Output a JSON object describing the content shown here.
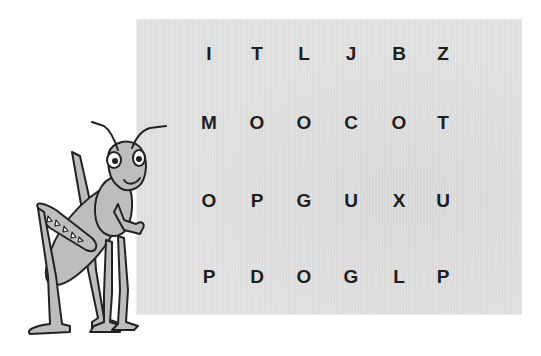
{
  "puzzle": {
    "type": "letter-grid",
    "rows": [
      [
        "I",
        "T",
        "L",
        "J",
        "B",
        "Z"
      ],
      [
        "M",
        "O",
        "O",
        "C",
        "O",
        "T"
      ],
      [
        "O",
        "P",
        "G",
        "U",
        "X",
        "U"
      ],
      [
        "P",
        "D",
        "O",
        "G",
        "L",
        "P"
      ]
    ]
  },
  "illustration": {
    "subject": "grasshopper-cartoon"
  },
  "colors": {
    "paper": "#e2e2e2",
    "letter": "#1e1e1e",
    "grasshopper_fill": "#bdbdbd",
    "outline": "#222222"
  }
}
